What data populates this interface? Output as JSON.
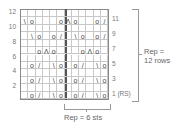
{
  "chart": {
    "columns": 12,
    "rows": 12,
    "left_row_labels": [
      "12",
      "10",
      "8",
      "6",
      "4",
      "2"
    ],
    "right_row_labels": [
      "11",
      "9",
      "7",
      "5",
      "3",
      "1 (RS)"
    ],
    "rep_rows_label_1": "Rep =",
    "rep_rows_label_2": "12 rows",
    "rep_sts_label": "Rep = 6 sts",
    "symbols": [
      {
        "row": 11,
        "col": 1,
        "g": "\\"
      },
      {
        "row": 11,
        "col": 2,
        "g": "o"
      },
      {
        "row": 11,
        "col": 6,
        "g": "o"
      },
      {
        "row": 11,
        "col": 7,
        "g": "Λ"
      },
      {
        "row": 11,
        "col": 8,
        "g": "o"
      },
      {
        "row": 11,
        "col": 11,
        "g": "o"
      },
      {
        "row": 11,
        "col": 12,
        "g": "/"
      },
      {
        "row": 9,
        "col": 2,
        "g": "\\"
      },
      {
        "row": 9,
        "col": 3,
        "g": "o"
      },
      {
        "row": 9,
        "col": 5,
        "g": "o"
      },
      {
        "row": 9,
        "col": 6,
        "g": "/"
      },
      {
        "row": 9,
        "col": 8,
        "g": "\\"
      },
      {
        "row": 9,
        "col": 9,
        "g": "o"
      },
      {
        "row": 9,
        "col": 11,
        "g": "o"
      },
      {
        "row": 9,
        "col": 12,
        "g": "/"
      },
      {
        "row": 7,
        "col": 3,
        "g": "o"
      },
      {
        "row": 7,
        "col": 4,
        "g": "Λ"
      },
      {
        "row": 7,
        "col": 5,
        "g": "o"
      },
      {
        "row": 7,
        "col": 9,
        "g": "o"
      },
      {
        "row": 7,
        "col": 10,
        "g": "Λ"
      },
      {
        "row": 7,
        "col": 11,
        "g": "o"
      },
      {
        "row": 5,
        "col": 2,
        "g": "o"
      },
      {
        "row": 5,
        "col": 3,
        "g": "/"
      },
      {
        "row": 5,
        "col": 5,
        "g": "\\"
      },
      {
        "row": 5,
        "col": 6,
        "g": "o"
      },
      {
        "row": 5,
        "col": 8,
        "g": "o"
      },
      {
        "row": 5,
        "col": 9,
        "g": "/"
      },
      {
        "row": 5,
        "col": 11,
        "g": "\\"
      },
      {
        "row": 5,
        "col": 12,
        "g": "o"
      },
      {
        "row": 3,
        "col": 2,
        "g": "o"
      },
      {
        "row": 3,
        "col": 3,
        "g": "/"
      },
      {
        "row": 3,
        "col": 5,
        "g": "\\"
      },
      {
        "row": 3,
        "col": 6,
        "g": "o"
      },
      {
        "row": 3,
        "col": 8,
        "g": "o"
      },
      {
        "row": 3,
        "col": 9,
        "g": "/"
      },
      {
        "row": 3,
        "col": 11,
        "g": "\\"
      },
      {
        "row": 3,
        "col": 12,
        "g": "o"
      },
      {
        "row": 1,
        "col": 2,
        "g": "o"
      },
      {
        "row": 1,
        "col": 3,
        "g": "/"
      },
      {
        "row": 1,
        "col": 5,
        "g": "\\"
      },
      {
        "row": 1,
        "col": 6,
        "g": "o"
      },
      {
        "row": 1,
        "col": 8,
        "g": "o"
      },
      {
        "row": 1,
        "col": 9,
        "g": "/"
      },
      {
        "row": 1,
        "col": 11,
        "g": "\\"
      },
      {
        "row": 1,
        "col": 12,
        "g": "o"
      }
    ]
  }
}
